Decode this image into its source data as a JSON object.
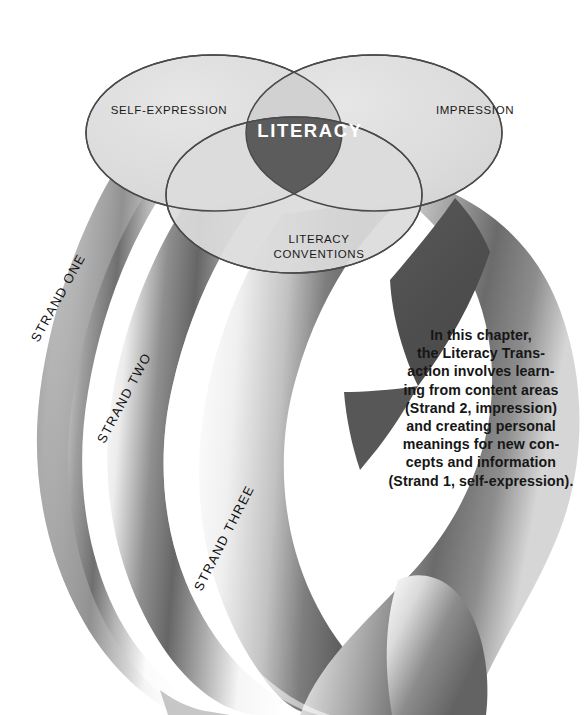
{
  "figure": {
    "background_color": "#ffffff"
  },
  "venn": {
    "circles": [
      {
        "id": "self-expression",
        "label": "SELF-EXPRESSION",
        "position": "upper-left",
        "fill": "#dcdcdc",
        "stroke": "#4a4a4a"
      },
      {
        "id": "impression",
        "label": "IMPRESSION",
        "position": "upper-right",
        "fill": "#dcdcdc",
        "stroke": "#4a4a4a"
      },
      {
        "id": "literacy-conventions",
        "label": "LITERACY\nCONVENTIONS",
        "label_line1": "LITERACY",
        "label_line2": "CONVENTIONS",
        "position": "lower-center",
        "fill": "#dcdcdc",
        "stroke": "#4a4a4a"
      }
    ],
    "intersection": {
      "label": "LITERACY",
      "fill": "#5c5c5c",
      "text_color": "#ffffff"
    },
    "overlap_fill": "#d0d0d0"
  },
  "strands": [
    {
      "id": "strand-one",
      "label": "STRAND ONE",
      "angle": -61
    },
    {
      "id": "strand-two",
      "label": "STRAND TWO",
      "angle": -62
    },
    {
      "id": "strand-three",
      "label": "STRAND THREE",
      "angle": -63
    }
  ],
  "caption": {
    "text": "In this chapter,\nthe Literacy Trans-\naction involves learn-\ning from content areas\n(Strand 2, impression)\nand creating personal\nmeanings for new con-\ncepts and information\n(Strand 1, self-expression)."
  },
  "colors": {
    "ink": "#161616",
    "ellipse_fill": "#dcdcdc",
    "ellipse_stroke": "#4a4a4a",
    "center_fill": "#5c5c5c",
    "shadow_dark": "#4e4e4e",
    "ribbon_light": "#ffffff",
    "ribbon_mid": "#b9b9b9",
    "ribbon_dark": "#6e6e6e"
  }
}
